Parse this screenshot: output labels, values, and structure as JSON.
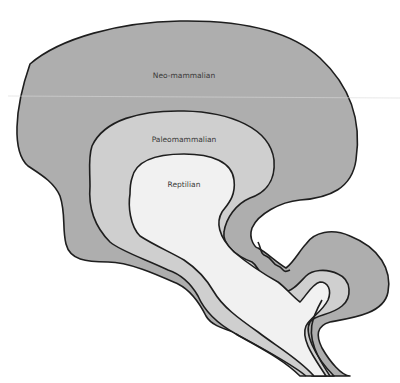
{
  "diagram": {
    "layers": [
      {
        "id": "neo",
        "label": "Neo-mammalian",
        "fill": "#aeaeae",
        "label_pos": [
          184,
          76
        ]
      },
      {
        "id": "paleo",
        "label": "Paleomammalian",
        "fill": "#cfcfcf",
        "label_pos": [
          184,
          140
        ]
      },
      {
        "id": "reptilian",
        "label": "Reptilian",
        "fill": "#f1f1f1",
        "label_pos": [
          184,
          185
        ]
      }
    ],
    "colors": {
      "background": "#ffffff",
      "outline": "#1e1e1e",
      "label": "#3a3a3a"
    }
  }
}
